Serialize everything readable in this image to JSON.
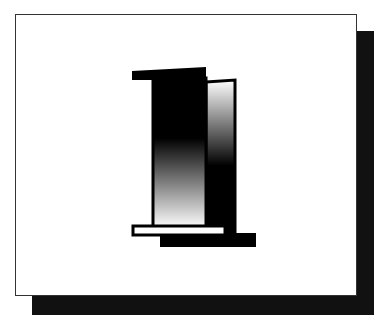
{
  "figure": {
    "label": "1",
    "colors": {
      "background": "#ffffff",
      "shadow": "#111111",
      "frame_border": "#333333",
      "glyph_dark": "#000000",
      "glyph_light": "#ffffff"
    }
  }
}
